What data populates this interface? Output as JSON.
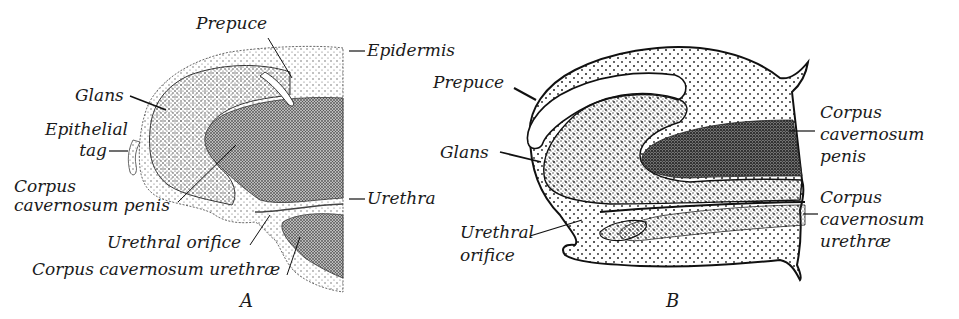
{
  "figure_a": {
    "caption": "A",
    "labels": {
      "prepuce": "Prepuce",
      "epidermis": "Epidermis",
      "glans": "Glans",
      "epithelial_tag_1": "Epithelial",
      "epithelial_tag_2": "tag",
      "corpus_cav_penis_1": "Corpus",
      "corpus_cav_penis_2": "cavernosum penis",
      "urethra": "Urethra",
      "urethral_orifice": "Urethral orifice",
      "corpus_cav_urethrae": "Corpus cavernosum urethræ"
    }
  },
  "figure_b": {
    "caption": "B",
    "labels": {
      "prepuce": "Prepuce",
      "glans": "Glans",
      "urethral_orifice_1": "Urethral",
      "urethral_orifice_2": "orifice",
      "corpus_cav_penis_1": "Corpus",
      "corpus_cav_penis_2": "cavernosum",
      "corpus_cav_penis_3": "penis",
      "corpus_cav_urethrae_1": "Corpus",
      "corpus_cav_urethrae_2": "cavernosum",
      "corpus_cav_urethrae_3": "urethræ"
    }
  }
}
